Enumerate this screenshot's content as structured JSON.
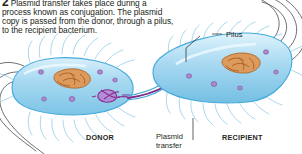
{
  "figure": {
    "step_number": "2",
    "caption": "Plasmid transfer takes place during a process known as conjugation. The plasmid copy is passed from the donor, through a pilus, to the recipient bacterium.",
    "labels": {
      "pilus": "Pilus",
      "donor": "DONOR",
      "recipient": "RECIPIENT",
      "transfer": "Plasmid\ntransfer"
    },
    "colors": {
      "cell_fill": "#a8d9f0",
      "cell_fill_light": "#cfeafa",
      "cell_outline": "#3aa6d8",
      "nucleoid": "#d98b4a",
      "nucleoid_dark": "#a85f28",
      "plasmid": "#8c2f8c",
      "ribosome": "#9b6bb5",
      "flagella": "#4a4a5a",
      "pili": "#7fbfe0",
      "text": "#231f20"
    }
  }
}
